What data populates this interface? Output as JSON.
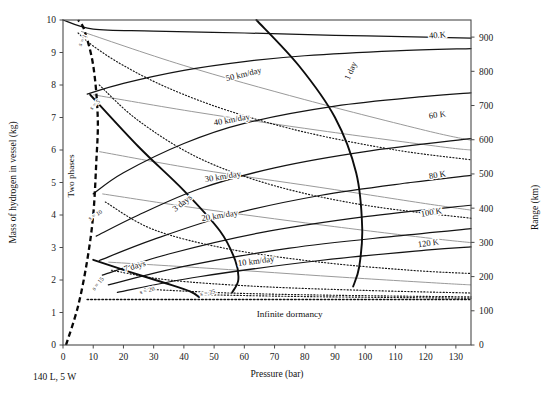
{
  "figure": {
    "caption": "140 L, 5 W",
    "region_labels": {
      "two_phases": "Two phases",
      "infinite_dormancy": "Infinite dormancy"
    }
  },
  "chart_data": {
    "type": "line",
    "title": "",
    "xlabel": "Pressure (bar)",
    "ylabel": "Mass of hydrogen in vessel (kg)",
    "y2label": "Range (km)",
    "xlim": [
      0,
      135
    ],
    "ylim": [
      0,
      10
    ],
    "y2lim": [
      0,
      950
    ],
    "grid": false,
    "legend": "none (curves labeled inline)",
    "xticks": [
      0,
      10,
      20,
      30,
      40,
      50,
      60,
      70,
      80,
      90,
      100,
      110,
      120,
      130
    ],
    "xticklabels": [
      "0",
      "10",
      "20",
      "30",
      "40",
      "50",
      "60",
      "70",
      "80",
      "90",
      "100",
      "110",
      "120",
      "130"
    ],
    "yticks": [
      0,
      1,
      2,
      3,
      4,
      5,
      6,
      7,
      8,
      9,
      10
    ],
    "yticklabels": [
      "0",
      "1",
      "2",
      "3",
      "4",
      "5",
      "6",
      "7",
      "8",
      "9",
      "10"
    ],
    "y2ticks": [
      0,
      100,
      200,
      300,
      400,
      500,
      600,
      700,
      800,
      900
    ],
    "y2ticklabels": [
      "0",
      "100",
      "200",
      "300",
      "400",
      "500",
      "600",
      "700",
      "800",
      "900"
    ],
    "annotations": [
      {
        "text": "s = 1",
        "x": 7,
        "y": 9.35
      },
      {
        "text": "s = 5",
        "x": 11,
        "y": 7.35
      },
      {
        "text": "s = 10",
        "x": 11,
        "y": 3.95
      },
      {
        "text": "s = 15",
        "x": 12,
        "y": 1.85
      },
      {
        "text": "s = 20",
        "x": 28,
        "y": 1.62
      },
      {
        "text": "s = 25",
        "x": 48,
        "y": 1.55
      },
      {
        "text": "1 day",
        "x": 96,
        "y": 8.4
      },
      {
        "text": "3 days",
        "x": 40,
        "y": 4.3
      },
      {
        "text": "7 days",
        "x": 24,
        "y": 2.35
      },
      {
        "text": "50 km/day",
        "x": 60,
        "y": 8.25
      },
      {
        "text": "40 km/day",
        "x": 56,
        "y": 6.85
      },
      {
        "text": "30 km/day",
        "x": 53,
        "y": 5.1
      },
      {
        "text": "20 km/day",
        "x": 52,
        "y": 3.9
      },
      {
        "text": "10 km/day",
        "x": 64,
        "y": 2.5
      },
      {
        "text": "40 K",
        "x": 124,
        "y": 9.45
      },
      {
        "text": "60 K",
        "x": 124,
        "y": 7.0
      },
      {
        "text": "80 K",
        "x": 124,
        "y": 5.15
      },
      {
        "text": "100 K",
        "x": 122,
        "y": 4.0
      },
      {
        "text": "120 K",
        "x": 121,
        "y": 3.05
      },
      {
        "text": "Two phases",
        "x": 3.5,
        "y": 5.2
      },
      {
        "text": "Infinite dormancy",
        "x": 75,
        "y": 0.85
      }
    ],
    "series": [
      {
        "name": "Isotherm 40 K",
        "style": "solid-black",
        "points": [
          [
            0,
            10.0
          ],
          [
            10,
            9.72
          ],
          [
            30,
            9.66
          ],
          [
            60,
            9.6
          ],
          [
            90,
            9.53
          ],
          [
            120,
            9.47
          ],
          [
            135,
            9.44
          ]
        ]
      },
      {
        "name": "Isotherm 60 K",
        "style": "solid-black",
        "points": [
          [
            8,
            7.72
          ],
          [
            20,
            8.05
          ],
          [
            40,
            8.45
          ],
          [
            60,
            8.72
          ],
          [
            80,
            8.9
          ],
          [
            110,
            9.05
          ],
          [
            135,
            9.12
          ]
        ]
      },
      {
        "name": "Isotherm 80 K",
        "style": "solid-black",
        "points": [
          [
            10,
            4.65
          ],
          [
            20,
            5.3
          ],
          [
            40,
            6.2
          ],
          [
            60,
            6.82
          ],
          [
            90,
            7.35
          ],
          [
            120,
            7.65
          ],
          [
            135,
            7.76
          ]
        ]
      },
      {
        "name": "Isotherm 100 K",
        "style": "solid-black",
        "points": [
          [
            11,
            3.35
          ],
          [
            25,
            4.0
          ],
          [
            45,
            4.8
          ],
          [
            70,
            5.45
          ],
          [
            100,
            5.95
          ],
          [
            135,
            6.35
          ]
        ]
      },
      {
        "name": "Isotherm 120 K",
        "style": "solid-black",
        "points": [
          [
            12,
            2.6
          ],
          [
            30,
            3.25
          ],
          [
            55,
            4.0
          ],
          [
            85,
            4.6
          ],
          [
            115,
            5.0
          ],
          [
            135,
            5.22
          ]
        ]
      },
      {
        "name": "Isotherm 140 K",
        "style": "solid-black",
        "points": [
          [
            13,
            2.15
          ],
          [
            35,
            2.8
          ],
          [
            65,
            3.45
          ],
          [
            100,
            3.95
          ],
          [
            135,
            4.3
          ]
        ]
      },
      {
        "name": "Isotherm 160 K",
        "style": "solid-black",
        "points": [
          [
            15,
            1.85
          ],
          [
            40,
            2.42
          ],
          [
            75,
            2.98
          ],
          [
            110,
            3.35
          ],
          [
            135,
            3.58
          ]
        ]
      },
      {
        "name": "Isotherm 180 K",
        "style": "solid-black",
        "points": [
          [
            18,
            1.62
          ],
          [
            45,
            2.1
          ],
          [
            85,
            2.6
          ],
          [
            120,
            2.92
          ],
          [
            135,
            3.02
          ]
        ]
      },
      {
        "name": "Dormancy s = 1",
        "style": "dotted",
        "points": [
          [
            5,
            9.6
          ],
          [
            10,
            9.2
          ],
          [
            20,
            8.6
          ],
          [
            35,
            7.9
          ],
          [
            55,
            7.2
          ],
          [
            80,
            6.55
          ],
          [
            110,
            6.0
          ],
          [
            135,
            5.7
          ]
        ]
      },
      {
        "name": "Dormancy s = 5",
        "style": "dotted",
        "points": [
          [
            12,
            8.0
          ],
          [
            25,
            6.9
          ],
          [
            45,
            5.75
          ],
          [
            70,
            4.9
          ],
          [
            100,
            4.3
          ],
          [
            135,
            3.9
          ]
        ]
      },
      {
        "name": "Dormancy s = 10",
        "style": "dotted",
        "points": [
          [
            14,
            4.4
          ],
          [
            30,
            3.55
          ],
          [
            55,
            2.95
          ],
          [
            85,
            2.55
          ],
          [
            115,
            2.3
          ],
          [
            135,
            2.2
          ]
        ]
      },
      {
        "name": "Dormancy s = 15",
        "style": "dotted",
        "points": [
          [
            16,
            2.3
          ],
          [
            35,
            2.0
          ],
          [
            65,
            1.8
          ],
          [
            100,
            1.68
          ],
          [
            135,
            1.6
          ]
        ]
      },
      {
        "name": "Dormancy s = 20",
        "style": "dotted",
        "points": [
          [
            27,
            1.72
          ],
          [
            55,
            1.6
          ],
          [
            90,
            1.53
          ],
          [
            135,
            1.48
          ]
        ]
      },
      {
        "name": "Dormancy s = 25",
        "style": "dotted",
        "points": [
          [
            46,
            1.55
          ],
          [
            80,
            1.49
          ],
          [
            135,
            1.44
          ]
        ]
      },
      {
        "name": "Range 50 km/day",
        "style": "gray",
        "points": [
          [
            6,
            9.65
          ],
          [
            40,
            8.6
          ],
          [
            80,
            7.55
          ],
          [
            120,
            6.6
          ],
          [
            135,
            6.3
          ]
        ]
      },
      {
        "name": "Range 40 km/day",
        "style": "gray",
        "points": [
          [
            10,
            7.7
          ],
          [
            45,
            7.15
          ],
          [
            85,
            6.6
          ],
          [
            125,
            6.1
          ],
          [
            135,
            6.0
          ]
        ]
      },
      {
        "name": "Range 30 km/day",
        "style": "gray",
        "points": [
          [
            12,
            5.95
          ],
          [
            45,
            5.4
          ],
          [
            85,
            4.85
          ],
          [
            120,
            4.35
          ],
          [
            135,
            4.15
          ]
        ]
      },
      {
        "name": "Range 20 km/day",
        "style": "gray",
        "points": [
          [
            13,
            4.65
          ],
          [
            45,
            4.2
          ],
          [
            85,
            3.7
          ],
          [
            120,
            3.3
          ],
          [
            135,
            3.15
          ]
        ]
      },
      {
        "name": "Range 10 km/day",
        "style": "gray",
        "points": [
          [
            15,
            2.55
          ],
          [
            50,
            2.35
          ],
          [
            90,
            2.1
          ],
          [
            125,
            1.9
          ],
          [
            135,
            1.85
          ]
        ]
      },
      {
        "name": "Dormancy 1 day",
        "style": "solid-heavy",
        "points": [
          [
            64,
            10.0
          ],
          [
            78,
            8.6
          ],
          [
            90,
            7.0
          ],
          [
            97,
            5.3
          ],
          [
            99,
            3.6
          ],
          [
            98,
            2.4
          ],
          [
            96,
            1.8
          ]
        ]
      },
      {
        "name": "Dormancy 3 days",
        "style": "solid-heavy",
        "points": [
          [
            9,
            7.7
          ],
          [
            25,
            6.1
          ],
          [
            40,
            4.75
          ],
          [
            52,
            3.5
          ],
          [
            57,
            2.6
          ],
          [
            58,
            2.0
          ],
          [
            56,
            1.62
          ]
        ]
      },
      {
        "name": "Dormancy 7 days",
        "style": "solid-heavy",
        "points": [
          [
            10,
            2.62
          ],
          [
            22,
            2.25
          ],
          [
            34,
            1.9
          ],
          [
            42,
            1.65
          ],
          [
            45,
            1.48
          ]
        ]
      },
      {
        "name": "Two phase boundary",
        "style": "dashed-thick",
        "points": [
          [
            1,
            0.0
          ],
          [
            5,
            1.2
          ],
          [
            8,
            2.6
          ],
          [
            10,
            4.0
          ],
          [
            11,
            5.6
          ],
          [
            11.5,
            7.0
          ],
          [
            10,
            8.6
          ],
          [
            7,
            9.7
          ],
          [
            5,
            10.0
          ]
        ]
      },
      {
        "name": "Infinite dormancy line",
        "style": "dotted-heavy",
        "points": [
          [
            8,
            1.4
          ],
          [
            135,
            1.4
          ]
        ]
      }
    ]
  }
}
